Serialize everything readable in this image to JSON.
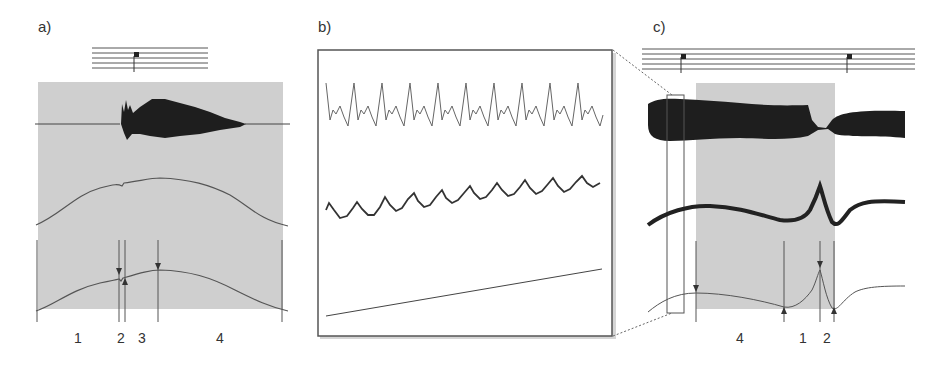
{
  "panels": {
    "a": {
      "label": "a)",
      "segment_numbers": [
        "1",
        "2",
        "3",
        "4"
      ]
    },
    "b": {
      "label": "b)"
    },
    "c": {
      "label": "c)",
      "segment_numbers": [
        "4",
        "1",
        "2"
      ]
    }
  },
  "colors": {
    "shade": "#cfcfcf",
    "waveform": "#2a2a2a",
    "line": "#555555",
    "frame": "#444444"
  }
}
